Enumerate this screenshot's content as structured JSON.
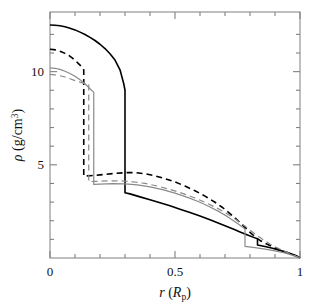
{
  "figure": {
    "background": "#ffffff",
    "frame_color": "#808080",
    "width": 318,
    "height": 304
  },
  "axes": {
    "x": {
      "label_italic": "r",
      "label_paren_open": " (",
      "label_var": "R",
      "label_sub": "p",
      "label_paren_close": ")",
      "ticks": [
        0,
        0.5,
        1
      ],
      "tick_labels": [
        "0",
        "0.5",
        "1"
      ],
      "minor_ticks": [
        0.1,
        0.2,
        0.3,
        0.4,
        0.6,
        0.7,
        0.8,
        0.9
      ],
      "range": [
        0,
        1
      ]
    },
    "y": {
      "label_rho": "ρ",
      "label_unit_open": " (g/cm",
      "label_exp": "3",
      "label_unit_close": ")",
      "ticks": [
        5,
        10
      ],
      "tick_labels": [
        "5",
        "10"
      ],
      "minor_ticks": [
        1,
        2,
        3,
        4,
        6,
        7,
        8,
        9,
        11,
        12
      ],
      "range": [
        0,
        13.2
      ]
    }
  },
  "chart_data": {
    "type": "line",
    "title": "",
    "xlabel": "r (R_p)",
    "ylabel": "rho (g/cm^3)",
    "xlim": [
      0,
      1
    ],
    "ylim": [
      0,
      13.2
    ],
    "grid": false,
    "legend": "none",
    "xticks": [
      0,
      0.5,
      1
    ],
    "yticks": [
      5,
      10
    ],
    "series": [
      {
        "name": "black-solid",
        "color": "#000000",
        "style": "solid",
        "width": 1.6,
        "central_density": 12.5,
        "discontinuity_r": 0.3,
        "discontinuity_from": 9.0,
        "discontinuity_to": 3.5,
        "step_r": 0.83,
        "surface_r": 1.0,
        "points": [
          [
            0.0,
            12.5
          ],
          [
            0.02,
            12.49
          ],
          [
            0.04,
            12.46
          ],
          [
            0.06,
            12.41
          ],
          [
            0.08,
            12.33
          ],
          [
            0.1,
            12.24
          ],
          [
            0.12,
            12.12
          ],
          [
            0.14,
            11.99
          ],
          [
            0.16,
            11.84
          ],
          [
            0.18,
            11.67
          ],
          [
            0.2,
            11.47
          ],
          [
            0.22,
            11.24
          ],
          [
            0.24,
            10.96
          ],
          [
            0.26,
            10.62
          ],
          [
            0.28,
            10.1
          ],
          [
            0.295,
            9.35
          ],
          [
            0.3,
            9.0
          ],
          [
            0.3,
            3.5
          ],
          [
            0.32,
            3.44
          ],
          [
            0.36,
            3.28
          ],
          [
            0.4,
            3.12
          ],
          [
            0.44,
            2.96
          ],
          [
            0.48,
            2.8
          ],
          [
            0.52,
            2.62
          ],
          [
            0.56,
            2.44
          ],
          [
            0.6,
            2.25
          ],
          [
            0.64,
            2.05
          ],
          [
            0.68,
            1.84
          ],
          [
            0.7,
            1.73
          ],
          [
            0.72,
            1.62
          ],
          [
            0.74,
            1.51
          ],
          [
            0.76,
            1.4
          ],
          [
            0.79,
            1.24
          ],
          [
            0.82,
            1.08
          ],
          [
            0.83,
            1.03
          ],
          [
            0.83,
            0.7
          ],
          [
            0.86,
            0.62
          ],
          [
            0.89,
            0.52
          ],
          [
            0.92,
            0.41
          ],
          [
            0.95,
            0.29
          ],
          [
            0.975,
            0.18
          ],
          [
            0.99,
            0.09
          ],
          [
            1.0,
            0.0
          ]
        ]
      },
      {
        "name": "black-dashed",
        "color": "#000000",
        "style": "dashed",
        "width": 1.6,
        "central_density": 11.2,
        "discontinuity_r": 0.135,
        "discontinuity_from": 10.1,
        "discontinuity_to": 4.4,
        "surface_r": 1.0,
        "points": [
          [
            0.0,
            11.2
          ],
          [
            0.015,
            11.18
          ],
          [
            0.03,
            11.14
          ],
          [
            0.045,
            11.07
          ],
          [
            0.06,
            10.98
          ],
          [
            0.075,
            10.87
          ],
          [
            0.09,
            10.72
          ],
          [
            0.105,
            10.55
          ],
          [
            0.12,
            10.35
          ],
          [
            0.132,
            10.15
          ],
          [
            0.135,
            10.1
          ],
          [
            0.135,
            4.4
          ],
          [
            0.16,
            4.41
          ],
          [
            0.2,
            4.46
          ],
          [
            0.25,
            4.53
          ],
          [
            0.3,
            4.58
          ],
          [
            0.34,
            4.58
          ],
          [
            0.38,
            4.52
          ],
          [
            0.42,
            4.41
          ],
          [
            0.46,
            4.26
          ],
          [
            0.5,
            4.08
          ],
          [
            0.54,
            3.86
          ],
          [
            0.58,
            3.61
          ],
          [
            0.62,
            3.32
          ],
          [
            0.66,
            2.99
          ],
          [
            0.69,
            2.71
          ],
          [
            0.715,
            2.44
          ],
          [
            0.74,
            2.15
          ],
          [
            0.76,
            1.9
          ],
          [
            0.78,
            1.64
          ],
          [
            0.8,
            1.38
          ],
          [
            0.82,
            1.14
          ],
          [
            0.84,
            0.94
          ],
          [
            0.865,
            0.76
          ],
          [
            0.89,
            0.6
          ],
          [
            0.915,
            0.46
          ],
          [
            0.94,
            0.33
          ],
          [
            0.965,
            0.21
          ],
          [
            0.985,
            0.1
          ],
          [
            1.0,
            0.0
          ]
        ]
      },
      {
        "name": "gray-solid",
        "color": "#8a8a8a",
        "style": "solid",
        "width": 1.2,
        "central_density": 10.2,
        "discontinuity_r": 0.175,
        "discontinuity_from": 8.9,
        "discontinuity_to": 3.95,
        "step_r": 0.78,
        "surface_r": 1.0,
        "points": [
          [
            0.0,
            10.2
          ],
          [
            0.02,
            10.18
          ],
          [
            0.04,
            10.12
          ],
          [
            0.06,
            10.02
          ],
          [
            0.08,
            9.9
          ],
          [
            0.1,
            9.75
          ],
          [
            0.12,
            9.57
          ],
          [
            0.14,
            9.35
          ],
          [
            0.16,
            9.08
          ],
          [
            0.172,
            8.93
          ],
          [
            0.175,
            8.9
          ],
          [
            0.175,
            3.95
          ],
          [
            0.2,
            3.96
          ],
          [
            0.25,
            3.99
          ],
          [
            0.3,
            3.98
          ],
          [
            0.35,
            3.92
          ],
          [
            0.4,
            3.82
          ],
          [
            0.45,
            3.67
          ],
          [
            0.5,
            3.48
          ],
          [
            0.55,
            3.25
          ],
          [
            0.6,
            2.99
          ],
          [
            0.64,
            2.74
          ],
          [
            0.68,
            2.46
          ],
          [
            0.71,
            2.22
          ],
          [
            0.74,
            1.95
          ],
          [
            0.76,
            1.76
          ],
          [
            0.775,
            1.61
          ],
          [
            0.78,
            1.56
          ],
          [
            0.78,
            0.62
          ],
          [
            0.82,
            0.56
          ],
          [
            0.86,
            0.48
          ],
          [
            0.9,
            0.38
          ],
          [
            0.935,
            0.28
          ],
          [
            0.965,
            0.17
          ],
          [
            0.985,
            0.08
          ],
          [
            1.0,
            0.0
          ]
        ]
      },
      {
        "name": "gray-dashed",
        "color": "#8a8a8a",
        "style": "dashed",
        "width": 1.2,
        "central_density": 9.85,
        "discontinuity_r": 0.155,
        "discontinuity_from": 9.3,
        "discontinuity_to": 4.1,
        "surface_r": 1.0,
        "points": [
          [
            0.0,
            9.85
          ],
          [
            0.02,
            9.83
          ],
          [
            0.04,
            9.78
          ],
          [
            0.06,
            9.71
          ],
          [
            0.08,
            9.62
          ],
          [
            0.1,
            9.52
          ],
          [
            0.12,
            9.44
          ],
          [
            0.14,
            9.35
          ],
          [
            0.153,
            9.31
          ],
          [
            0.155,
            9.3
          ],
          [
            0.155,
            4.1
          ],
          [
            0.18,
            4.11
          ],
          [
            0.23,
            4.14
          ],
          [
            0.28,
            4.14
          ],
          [
            0.33,
            4.09
          ],
          [
            0.38,
            4.0
          ],
          [
            0.43,
            3.86
          ],
          [
            0.48,
            3.68
          ],
          [
            0.53,
            3.47
          ],
          [
            0.58,
            3.22
          ],
          [
            0.625,
            2.96
          ],
          [
            0.665,
            2.7
          ],
          [
            0.7,
            2.44
          ],
          [
            0.73,
            2.19
          ],
          [
            0.755,
            1.96
          ],
          [
            0.78,
            1.71
          ],
          [
            0.805,
            1.45
          ],
          [
            0.83,
            1.19
          ],
          [
            0.855,
            0.96
          ],
          [
            0.88,
            0.75
          ],
          [
            0.905,
            0.57
          ],
          [
            0.93,
            0.41
          ],
          [
            0.955,
            0.26
          ],
          [
            0.978,
            0.13
          ],
          [
            1.0,
            0.0
          ]
        ]
      }
    ]
  }
}
